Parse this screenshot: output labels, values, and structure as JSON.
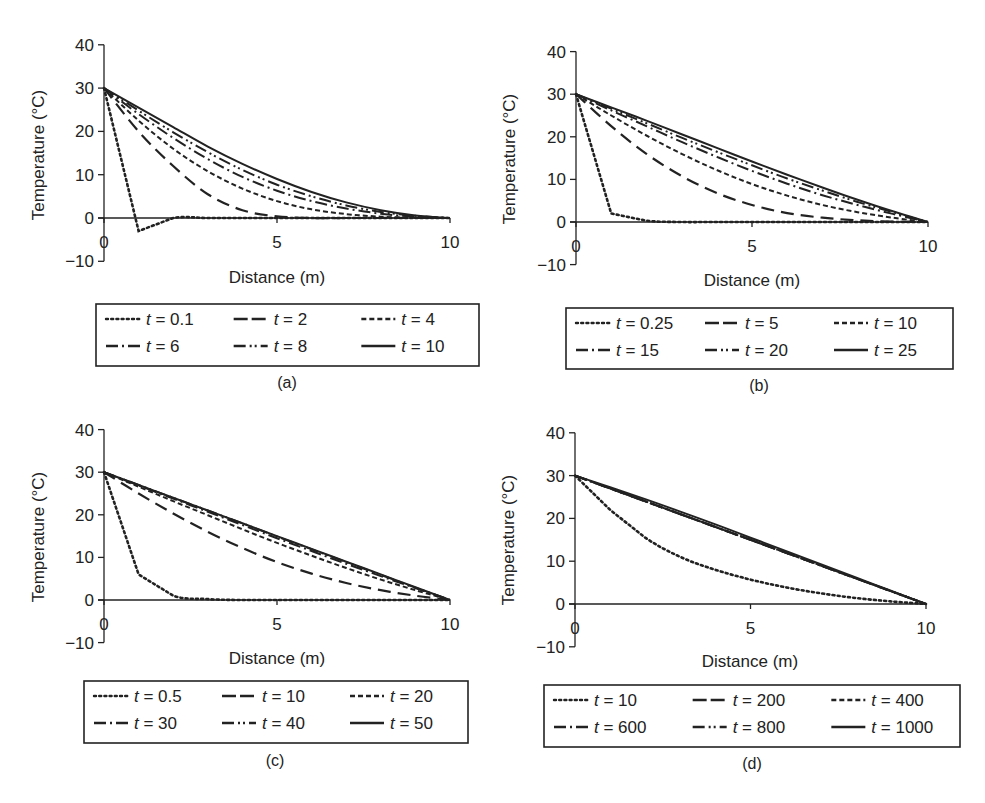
{
  "figure": {
    "panels": [
      "a",
      "b",
      "c",
      "d"
    ]
  },
  "chart_data": [
    {
      "panel": "a",
      "caption": "(a)",
      "type": "line",
      "title": "",
      "xlabel": "Distance (m)",
      "ylabel": "Temperature (°C)",
      "xlim": [
        0,
        10
      ],
      "ylim": [
        -10,
        40
      ],
      "xticks": [
        "0",
        "5",
        "10"
      ],
      "yticks": [
        "40",
        "30",
        "20",
        "10",
        "0",
        "−10"
      ],
      "grid": false,
      "legend_position": "below",
      "series": [
        {
          "name": "t = 0.1",
          "style": "dotted",
          "x": [
            0,
            1,
            2,
            3,
            4,
            5,
            6,
            7,
            8,
            9,
            10
          ],
          "values": [
            30,
            -3,
            0,
            0,
            0,
            0,
            0,
            0,
            0,
            0,
            0
          ]
        },
        {
          "name": "t = 2",
          "style": "long-dash",
          "x": [
            0,
            1,
            2,
            3,
            4,
            5,
            6,
            7,
            8,
            9,
            10
          ],
          "values": [
            30,
            20,
            12,
            5.5,
            1.8,
            0.4,
            0,
            0,
            0,
            0,
            0
          ]
        },
        {
          "name": "t = 4",
          "style": "short-dash",
          "x": [
            0,
            1,
            2,
            3,
            4,
            5,
            6,
            7,
            8,
            9,
            10
          ],
          "values": [
            30,
            22.5,
            16,
            10.8,
            6.8,
            3.9,
            2.0,
            0.9,
            0.3,
            0.1,
            0
          ]
        },
        {
          "name": "t = 6",
          "style": "dash-dot",
          "x": [
            0,
            1,
            2,
            3,
            4,
            5,
            6,
            7,
            8,
            9,
            10
          ],
          "values": [
            30,
            24,
            18.5,
            13.6,
            9.5,
            6.3,
            3.9,
            2.2,
            1.0,
            0.3,
            0
          ]
        },
        {
          "name": "t = 8",
          "style": "dash-dot-dot",
          "x": [
            0,
            1,
            2,
            3,
            4,
            5,
            6,
            7,
            8,
            9,
            10
          ],
          "values": [
            30,
            24.8,
            19.8,
            15.2,
            11.1,
            7.7,
            5.0,
            2.9,
            1.4,
            0.5,
            0
          ]
        },
        {
          "name": "t = 10",
          "style": "solid",
          "x": [
            0,
            1,
            2,
            3,
            4,
            5,
            6,
            7,
            8,
            9,
            10
          ],
          "values": [
            30,
            25.5,
            21,
            16.5,
            12.5,
            9,
            6,
            3.6,
            1.8,
            0.6,
            0
          ]
        }
      ]
    },
    {
      "panel": "b",
      "caption": "(b)",
      "type": "line",
      "title": "",
      "xlabel": "Distance (m)",
      "ylabel": "Temperature (°C)",
      "xlim": [
        0,
        10
      ],
      "ylim": [
        -10,
        40
      ],
      "xticks": [
        "0",
        "5",
        "10"
      ],
      "yticks": [
        "40",
        "30",
        "20",
        "10",
        "0",
        "−10"
      ],
      "grid": false,
      "legend_position": "below",
      "series": [
        {
          "name": "t = 0.25",
          "style": "dotted",
          "x": [
            0,
            1,
            2,
            3,
            4,
            5,
            6,
            7,
            8,
            9,
            10
          ],
          "values": [
            30,
            2,
            0.3,
            0,
            0,
            0,
            0,
            0,
            0,
            0,
            0
          ]
        },
        {
          "name": "t = 5",
          "style": "long-dash",
          "x": [
            0,
            1,
            2,
            3,
            4,
            5,
            6,
            7,
            8,
            9,
            10
          ],
          "values": [
            30,
            22.5,
            16,
            10.8,
            6.8,
            4.0,
            2.1,
            1.0,
            0.4,
            0.1,
            0
          ]
        },
        {
          "name": "t = 10",
          "style": "short-dash",
          "x": [
            0,
            1,
            2,
            3,
            4,
            5,
            6,
            7,
            8,
            9,
            10
          ],
          "values": [
            30,
            25,
            20.3,
            16.0,
            12.2,
            8.9,
            6.2,
            4.0,
            2.3,
            1.0,
            0
          ]
        },
        {
          "name": "t = 15",
          "style": "dash-dot",
          "x": [
            0,
            1,
            2,
            3,
            4,
            5,
            6,
            7,
            8,
            9,
            10
          ],
          "values": [
            30,
            26.2,
            22.5,
            18.8,
            15.3,
            12.0,
            9.0,
            6.3,
            4.0,
            1.9,
            0
          ]
        },
        {
          "name": "t = 20",
          "style": "dash-dot-dot",
          "x": [
            0,
            1,
            2,
            3,
            4,
            5,
            6,
            7,
            8,
            9,
            10
          ],
          "values": [
            30,
            26.6,
            23.2,
            19.8,
            16.5,
            13.3,
            10.2,
            7.4,
            4.7,
            2.3,
            0
          ]
        },
        {
          "name": "t = 25",
          "style": "solid",
          "x": [
            0,
            1,
            2,
            3,
            4,
            5,
            6,
            7,
            8,
            9,
            10
          ],
          "values": [
            30,
            26.9,
            23.8,
            20.6,
            17.4,
            14.2,
            11.1,
            8.1,
            5.2,
            2.5,
            0
          ]
        }
      ]
    },
    {
      "panel": "c",
      "caption": "(c)",
      "type": "line",
      "title": "",
      "xlabel": "Distance (m)",
      "ylabel": "Temperature (°C)",
      "xlim": [
        0,
        10
      ],
      "ylim": [
        -10,
        40
      ],
      "xticks": [
        "0",
        "5",
        "10"
      ],
      "yticks": [
        "40",
        "30",
        "20",
        "10",
        "0",
        "−10"
      ],
      "grid": false,
      "legend_position": "below",
      "series": [
        {
          "name": "t = 0.5",
          "style": "dotted",
          "x": [
            0,
            1,
            2,
            3,
            4,
            5,
            6,
            7,
            8,
            9,
            10
          ],
          "values": [
            30,
            6,
            1,
            0.2,
            0,
            0,
            0,
            0,
            0,
            0,
            0
          ]
        },
        {
          "name": "t = 10",
          "style": "long-dash",
          "x": [
            0,
            1,
            2,
            3,
            4,
            5,
            6,
            7,
            8,
            9,
            10
          ],
          "values": [
            30,
            25,
            20.3,
            16.0,
            12.2,
            8.9,
            6.2,
            4.0,
            2.3,
            1.0,
            0
          ]
        },
        {
          "name": "t = 20",
          "style": "short-dash",
          "x": [
            0,
            1,
            2,
            3,
            4,
            5,
            6,
            7,
            8,
            9,
            10
          ],
          "values": [
            30,
            26.6,
            23.2,
            19.9,
            16.6,
            13.4,
            10.4,
            7.5,
            4.8,
            2.3,
            0
          ]
        },
        {
          "name": "t = 30",
          "style": "dash-dot",
          "x": [
            0,
            1,
            2,
            3,
            4,
            5,
            6,
            7,
            8,
            9,
            10
          ],
          "values": [
            30,
            26.9,
            23.8,
            20.7,
            17.6,
            14.5,
            11.5,
            8.5,
            5.6,
            2.8,
            0
          ]
        },
        {
          "name": "t = 40",
          "style": "dash-dot-dot",
          "x": [
            0,
            1,
            2,
            3,
            4,
            5,
            6,
            7,
            8,
            9,
            10
          ],
          "values": [
            30,
            27,
            24,
            21,
            18,
            14.9,
            11.9,
            8.9,
            5.9,
            2.9,
            0
          ]
        },
        {
          "name": "t = 50",
          "style": "solid",
          "x": [
            0,
            1,
            2,
            3,
            4,
            5,
            6,
            7,
            8,
            9,
            10
          ],
          "values": [
            30,
            27,
            24,
            21,
            18,
            15,
            12,
            9,
            6,
            3,
            0
          ]
        }
      ]
    },
    {
      "panel": "d",
      "caption": "(d)",
      "type": "line",
      "title": "",
      "xlabel": "Distance (m)",
      "ylabel": "Temperature (°C)",
      "xlim": [
        0,
        10
      ],
      "ylim": [
        -10,
        40
      ],
      "xticks": [
        "0",
        "5",
        "10"
      ],
      "yticks": [
        "40",
        "30",
        "20",
        "10",
        "0",
        "−10"
      ],
      "grid": false,
      "legend_position": "below",
      "series": [
        {
          "name": "t = 10",
          "style": "dotted",
          "x": [
            0,
            1,
            2,
            3,
            4,
            5,
            6,
            7,
            8,
            9,
            10
          ],
          "values": [
            30,
            22,
            15.5,
            11,
            8,
            5.7,
            3.9,
            2.5,
            1.4,
            0.6,
            0
          ]
        },
        {
          "name": "t = 200",
          "style": "long-dash",
          "x": [
            0,
            10
          ],
          "values": [
            30,
            0
          ]
        },
        {
          "name": "t = 400",
          "style": "short-dash",
          "x": [
            0,
            10
          ],
          "values": [
            30,
            0
          ]
        },
        {
          "name": "t = 600",
          "style": "dash-dot",
          "x": [
            0,
            10
          ],
          "values": [
            30,
            0
          ]
        },
        {
          "name": "t = 800",
          "style": "dash-dot-dot",
          "x": [
            0,
            10
          ],
          "values": [
            30,
            0
          ]
        },
        {
          "name": "t = 1000",
          "style": "solid",
          "x": [
            0,
            1,
            2,
            3,
            4,
            5,
            6,
            7,
            8,
            9,
            10
          ],
          "values": [
            30,
            27.3,
            24.5,
            21.6,
            18.6,
            15.5,
            12.4,
            9.3,
            6.2,
            3.1,
            0
          ]
        }
      ]
    }
  ],
  "panels": {
    "a": {
      "caption": "(a)",
      "xlabel": "Distance (m)",
      "ylabel": "Temperature (°C)",
      "legend": [
        {
          "t": "t",
          "eq": " = 0.1"
        },
        {
          "t": "t",
          "eq": " = 2"
        },
        {
          "t": "t",
          "eq": " = 4"
        },
        {
          "t": "t",
          "eq": " = 6"
        },
        {
          "t": "t",
          "eq": " = 8"
        },
        {
          "t": "t",
          "eq": " = 10"
        }
      ]
    },
    "b": {
      "caption": "(b)",
      "xlabel": "Distance (m)",
      "ylabel": "Temperature (°C)",
      "legend": [
        {
          "t": "t",
          "eq": " = 0.25"
        },
        {
          "t": "t",
          "eq": " = 5"
        },
        {
          "t": "t",
          "eq": " = 10"
        },
        {
          "t": "t",
          "eq": " = 15"
        },
        {
          "t": "t",
          "eq": " = 20"
        },
        {
          "t": "t",
          "eq": " = 25"
        }
      ]
    },
    "c": {
      "caption": "(c)",
      "xlabel": "Distance (m)",
      "ylabel": "Temperature (°C)",
      "legend": [
        {
          "t": "t",
          "eq": " = 0.5"
        },
        {
          "t": "t",
          "eq": " = 10"
        },
        {
          "t": "t",
          "eq": " = 20"
        },
        {
          "t": "t",
          "eq": " = 30"
        },
        {
          "t": "t",
          "eq": " = 40"
        },
        {
          "t": "t",
          "eq": " = 50"
        }
      ]
    },
    "d": {
      "caption": "(d)",
      "xlabel": "Distance (m)",
      "ylabel": "Temperature (°C)",
      "legend": [
        {
          "t": "t",
          "eq": " = 10"
        },
        {
          "t": "t",
          "eq": " = 200"
        },
        {
          "t": "t",
          "eq": " = 400"
        },
        {
          "t": "t",
          "eq": " = 600"
        },
        {
          "t": "t",
          "eq": " = 800"
        },
        {
          "t": "t",
          "eq": " = 1000"
        }
      ]
    }
  },
  "ticks": {
    "y": [
      "40",
      "30",
      "20",
      "10",
      "0",
      "−10"
    ],
    "x": [
      "0",
      "5",
      "10"
    ]
  },
  "colors": {
    "ink": "#222222",
    "background": "#ffffff"
  }
}
